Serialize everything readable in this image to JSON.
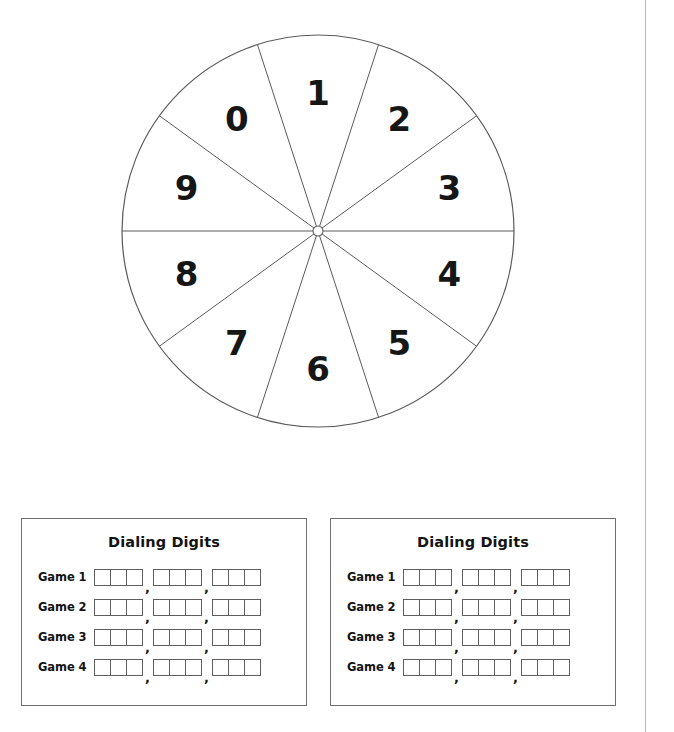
{
  "page": {
    "background_color": "#ffffff",
    "rule_color": "#b9b9b9",
    "clipped_header_text": " "
  },
  "spinner": {
    "name": "digit-spinner",
    "sector_count": 10,
    "outline_color": "#5a5a5a",
    "digit_color": "#161616",
    "hub_label": "spinner-hub",
    "digits": [
      {
        "value": "1",
        "angle_deg": 0
      },
      {
        "value": "2",
        "angle_deg": 36
      },
      {
        "value": "3",
        "angle_deg": 72
      },
      {
        "value": "4",
        "angle_deg": 108
      },
      {
        "value": "5",
        "angle_deg": 144
      },
      {
        "value": "6",
        "angle_deg": 180
      },
      {
        "value": "7",
        "angle_deg": 216
      },
      {
        "value": "8",
        "angle_deg": 252
      },
      {
        "value": "9",
        "angle_deg": 288
      },
      {
        "value": "0",
        "angle_deg": 324
      }
    ]
  },
  "panels": [
    {
      "id": "left",
      "title": "Dialing Digits",
      "rows": [
        {
          "label": "Game 1",
          "groups": [
            3,
            3,
            3
          ],
          "values": [
            "",
            "",
            ""
          ]
        },
        {
          "label": "Game 2",
          "groups": [
            3,
            3,
            3
          ],
          "values": [
            "",
            "",
            ""
          ]
        },
        {
          "label": "Game 3",
          "groups": [
            3,
            3,
            3
          ],
          "values": [
            "",
            "",
            ""
          ]
        },
        {
          "label": "Game 4",
          "groups": [
            3,
            3,
            3
          ],
          "values": [
            "",
            "",
            ""
          ]
        }
      ],
      "separator": ","
    },
    {
      "id": "right",
      "title": "Dialing Digits",
      "rows": [
        {
          "label": "Game 1",
          "groups": [
            3,
            3,
            3
          ],
          "values": [
            "",
            "",
            ""
          ]
        },
        {
          "label": "Game 2",
          "groups": [
            3,
            3,
            3
          ],
          "values": [
            "",
            "",
            ""
          ]
        },
        {
          "label": "Game 3",
          "groups": [
            3,
            3,
            3
          ],
          "values": [
            "",
            "",
            ""
          ]
        },
        {
          "label": "Game 4",
          "groups": [
            3,
            3,
            3
          ],
          "values": [
            "",
            "",
            ""
          ]
        }
      ],
      "separator": ","
    }
  ]
}
